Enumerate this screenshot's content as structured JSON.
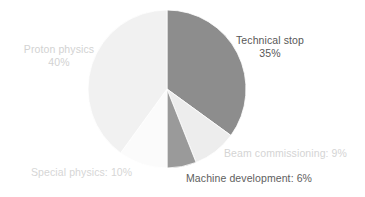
{
  "chart_data": {
    "type": "pie",
    "title": "",
    "subtitle": "",
    "xlabel": "",
    "ylabel": "",
    "legend_position": "none",
    "grid": false,
    "units": "%",
    "total": 100,
    "categories": [
      "Technical stop",
      "Beam commissioning",
      "Machine development",
      "Special physics",
      "Proton physics"
    ],
    "values": [
      35,
      9,
      6,
      10,
      40
    ],
    "slices": [
      {
        "name": "Technical stop",
        "value": 35,
        "value_text": "35%",
        "label_line1": "Technical stop",
        "label_line2": "35%",
        "color": "#8d8d8d",
        "label_color": "#575757",
        "start_angle_deg": 0,
        "end_angle_deg": 126
      },
      {
        "name": "Beam commissioning",
        "value": 9,
        "value_text": "9%",
        "label_line1": "Beam commissioning: 9%",
        "label_line2": "",
        "color": "#ededed",
        "label_color": "#d4d4d4",
        "start_angle_deg": 126,
        "end_angle_deg": 158.4
      },
      {
        "name": "Machine development",
        "value": 6,
        "value_text": "6%",
        "label_line1": "Machine development: 6%",
        "label_line2": "",
        "color": "#9a9a9a",
        "label_color": "#5e5e5e",
        "start_angle_deg": 158.4,
        "end_angle_deg": 180
      },
      {
        "name": "Special physics",
        "value": 10,
        "value_text": "10%",
        "label_line1": "Special physics: 10%",
        "label_line2": "",
        "color": "#fbfbfb",
        "label_color": "#d6d6d6",
        "start_angle_deg": 180,
        "end_angle_deg": 216
      },
      {
        "name": "Proton physics",
        "value": 40,
        "value_text": "40%",
        "label_line1": "Proton physics",
        "label_line2": "40%",
        "color": "#f1f1f1",
        "label_color": "#d2d2d2",
        "start_angle_deg": 216,
        "end_angle_deg": 360
      }
    ],
    "geometry": {
      "center_x": 167,
      "center_y": 89,
      "radius": 79
    },
    "background_color": "#ffffff"
  }
}
